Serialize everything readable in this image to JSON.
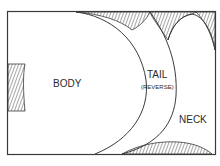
{
  "diagram": {
    "type": "pattern-layout",
    "colors": {
      "line": "#3a3a3a",
      "hatch": "#3a3a3a",
      "background": "#ffffff"
    },
    "pieces": [
      {
        "id": "body",
        "label": "BODY"
      },
      {
        "id": "tail",
        "label": "TAIL",
        "sublabel": "(REVERSE)"
      },
      {
        "id": "neck",
        "label": "NECK"
      }
    ],
    "waste_regions": [
      "top-left-arc",
      "top-middle",
      "top-right",
      "left-edge",
      "bottom-right"
    ]
  }
}
